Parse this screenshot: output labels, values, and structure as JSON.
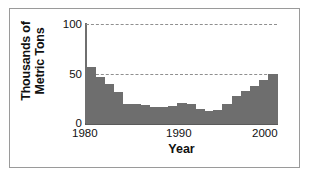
{
  "chart_data": {
    "type": "bar",
    "title": "",
    "subtitle": "",
    "xlabel": "Year",
    "ylabel": "Thousands of\nMetric Tons",
    "xlim": [
      1980,
      2000
    ],
    "ylim": [
      0,
      100
    ],
    "yticks": [
      0,
      50,
      100
    ],
    "ytick_labels": [
      "0",
      "50",
      "100"
    ],
    "xticks": [
      1980,
      1990,
      2000
    ],
    "xtick_labels": [
      "1980",
      "1990",
      "2000"
    ],
    "gridlines": {
      "horizontal_dashed_at": [
        50,
        100
      ],
      "vertical": false
    },
    "legend": null,
    "bar_color": "#6e6e6e",
    "categories": [
      "1980",
      "1981",
      "1982",
      "1983",
      "1984",
      "1985",
      "1986",
      "1987",
      "1988",
      "1989",
      "1990",
      "1991",
      "1992",
      "1993",
      "1994",
      "1995",
      "1996",
      "1997",
      "1998",
      "1999",
      "2000"
    ],
    "values": [
      57,
      47,
      40,
      32,
      20,
      20,
      19,
      17,
      17,
      18,
      21,
      20,
      15,
      13,
      14,
      20,
      28,
      33,
      38,
      44,
      50
    ],
    "series": [
      {
        "name": "Thousands of Metric Tons",
        "values": [
          57,
          47,
          40,
          32,
          20,
          20,
          19,
          17,
          17,
          18,
          21,
          20,
          15,
          13,
          14,
          20,
          28,
          33,
          38,
          44,
          50
        ]
      }
    ]
  },
  "axes": {
    "y_title": "Thousands of\nMetric Tons",
    "x_title": "Year",
    "y_tick_top": "100",
    "y_tick_mid": "50",
    "y_tick_bottom": "0",
    "x_tick_start": "1980",
    "x_tick_mid": "1990",
    "x_tick_end": "2000"
  },
  "style": {
    "background": "#ffffff",
    "frame_color": "#9a9a9a",
    "axis_color": "#5a5a5a",
    "grid_color": "#8f8f8f",
    "bar_color": "#6e6e6e",
    "text_color": "#111111"
  }
}
